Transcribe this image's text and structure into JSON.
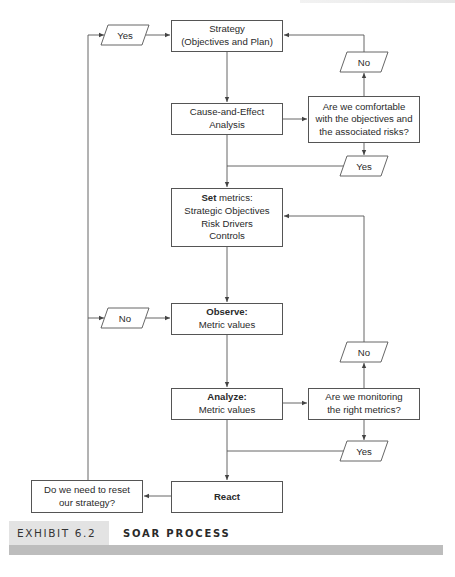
{
  "diagram": {
    "nodes": {
      "strategy": {
        "line1": "Strategy",
        "line2": "(Objectives and Plan)"
      },
      "cause_effect": {
        "line1": "Cause-and-Effect",
        "line2": "Analysis"
      },
      "question_comfortable": {
        "line1": "Are we comfortable",
        "line2": "with the objectives and",
        "line3": "the associated risks?"
      },
      "set_metrics": {
        "bold": "Set",
        "rest": " metrics:",
        "line2": "Strategic Objectives",
        "line3": "Risk Drivers",
        "line4": "Controls"
      },
      "observe": {
        "bold": "Observe:",
        "line2": "Metric values"
      },
      "analyze": {
        "bold": "Analyze:",
        "line2": "Metric values"
      },
      "question_monitoring": {
        "line1": "Are we monitoring",
        "line2": "the right metrics?"
      },
      "react": {
        "bold": "React"
      },
      "question_reset": {
        "line1": "Do we need to reset",
        "line2": "our strategy?"
      }
    },
    "decisions": {
      "yes_reset": "Yes",
      "no_comfortable": "No",
      "yes_comfortable": "Yes",
      "no_reset": "No",
      "no_monitoring": "No",
      "yes_monitoring": "Yes"
    },
    "edges": [
      {
        "from": "strategy",
        "to": "cause_effect"
      },
      {
        "from": "cause_effect",
        "to": "question_comfortable"
      },
      {
        "from": "question_comfortable",
        "to": "strategy",
        "label": "No"
      },
      {
        "from": "question_comfortable",
        "to": "set_metrics",
        "label": "Yes"
      },
      {
        "from": "set_metrics",
        "to": "observe"
      },
      {
        "from": "observe",
        "to": "analyze"
      },
      {
        "from": "analyze",
        "to": "question_monitoring"
      },
      {
        "from": "question_monitoring",
        "to": "set_metrics",
        "label": "No"
      },
      {
        "from": "question_monitoring",
        "to": "react",
        "label": "Yes"
      },
      {
        "from": "react",
        "to": "question_reset"
      },
      {
        "from": "question_reset",
        "to": "strategy",
        "label": "Yes"
      },
      {
        "from": "question_reset",
        "to": "observe",
        "label": "No"
      }
    ]
  },
  "caption": {
    "exhibit": "EXHIBIT 6.2",
    "title": "SOAR PROCESS"
  },
  "colors": {
    "line": "#555555",
    "caption_tag_bg": "#e3e3e3",
    "caption_bar": "#bdbdbd"
  }
}
